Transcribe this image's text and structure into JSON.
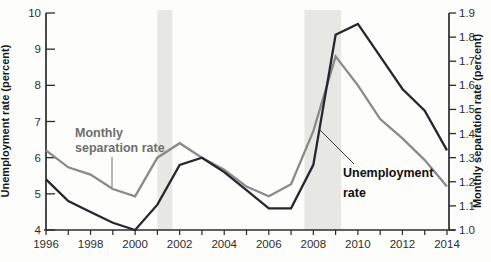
{
  "chart_data": {
    "type": "line",
    "x": [
      1996,
      1997,
      1998,
      1999,
      2000,
      2001,
      2002,
      2003,
      2004,
      2005,
      2006,
      2007,
      2008,
      2009,
      2010,
      2011,
      2012,
      2013,
      2014
    ],
    "series": [
      {
        "name": "Unemployment rate",
        "axis": "left",
        "color": "#26262e",
        "values": [
          5.4,
          4.8,
          4.5,
          4.2,
          4.0,
          4.7,
          5.8,
          6.0,
          5.6,
          5.1,
          4.6,
          4.6,
          5.8,
          9.4,
          9.7,
          8.8,
          7.9,
          7.3,
          6.2
        ]
      },
      {
        "name": "Monthly separation rate",
        "axis": "right",
        "color": "#8a8a8a",
        "values": [
          1.33,
          1.26,
          1.23,
          1.17,
          1.14,
          1.3,
          1.36,
          1.3,
          1.25,
          1.18,
          1.14,
          1.19,
          1.41,
          1.72,
          1.6,
          1.46,
          1.38,
          1.29,
          1.18
        ]
      }
    ],
    "left_axis": {
      "label": "Unemployment rate (percent)",
      "min": 4,
      "max": 10,
      "ticks": [
        4,
        5,
        6,
        7,
        8,
        9,
        10
      ]
    },
    "right_axis": {
      "label": "Monthly separation rate (percent)",
      "min": 1.0,
      "max": 1.9,
      "ticks": [
        "1.0",
        "1.1",
        "1.2",
        "1.3",
        "1.4",
        "1.5",
        "1.6",
        "1.7",
        "1.8",
        "1.9"
      ]
    },
    "x_axis": {
      "range": [
        1996,
        2014
      ],
      "minor_tick_every": 1,
      "labeled_ticks": [
        1996,
        1998,
        2000,
        2002,
        2004,
        2006,
        2008,
        2010,
        2012,
        2014
      ]
    },
    "recession_bands": {
      "color": "#e7e7e4",
      "ranges": [
        {
          "from": 2001.0,
          "to": 2001.67
        },
        {
          "from": 2007.6,
          "to": 2009.25
        }
      ]
    },
    "annotations": {
      "separation": {
        "lines": [
          "Monthly",
          "separation rate"
        ]
      },
      "unemployment": {
        "lines": [
          "Unemployment",
          "rate"
        ]
      }
    },
    "grid": "off",
    "legend": "inline-annotations"
  }
}
